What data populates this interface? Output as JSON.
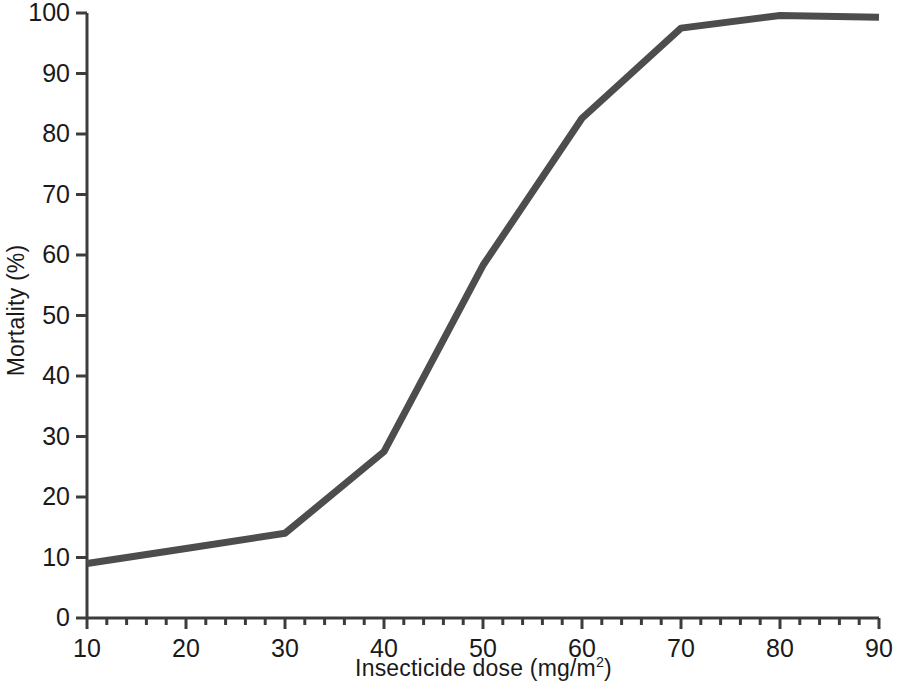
{
  "chart_data": {
    "type": "line",
    "title": "",
    "subtitle": "",
    "xlabel_text": "Insecticide dose (mg/m",
    "xlabel_sup": "2",
    "xlabel_tail": ")",
    "xlabel_full": "Insecticide dose (mg/m2)",
    "ylabel": "Mortality (%)",
    "xlim": [
      10,
      90
    ],
    "ylim": [
      0,
      100
    ],
    "grid": false,
    "legend": null,
    "x_major_step": 10,
    "x_minor_step": 2,
    "y_major_step": 10,
    "xticks": [
      10,
      20,
      30,
      40,
      50,
      60,
      70,
      80,
      90
    ],
    "xticklabels": [
      "10",
      "20",
      "30",
      "40",
      "50",
      "60",
      "70",
      "80",
      "90"
    ],
    "yticks": [
      0,
      10,
      20,
      30,
      40,
      50,
      60,
      70,
      80,
      90,
      100
    ],
    "yticklabels": [
      "0",
      "10",
      "20",
      "30",
      "40",
      "50",
      "60",
      "70",
      "80",
      "90",
      "100"
    ],
    "x": [
      10,
      20,
      30,
      40,
      50,
      60,
      70,
      80,
      90
    ],
    "values": [
      9,
      11.5,
      14,
      27.5,
      58.3,
      82.6,
      97.5,
      99.6,
      99.3
    ],
    "series": [
      {
        "name": "Mortality",
        "color": "#4d4d4d",
        "line_width": 7,
        "x": [
          10,
          20,
          30,
          40,
          50,
          60,
          70,
          80,
          90
        ],
        "values": [
          9,
          11.5,
          14,
          27.5,
          58.3,
          82.6,
          97.5,
          99.6,
          99.3
        ]
      }
    ],
    "axis_color": "#3c3c3c",
    "background": "#ffffff"
  },
  "axes": {
    "y_title": "Mortality (%)",
    "x_title_prefix": "Insecticide dose (mg/m",
    "x_title_sup": "2",
    "x_title_suffix": ")"
  }
}
